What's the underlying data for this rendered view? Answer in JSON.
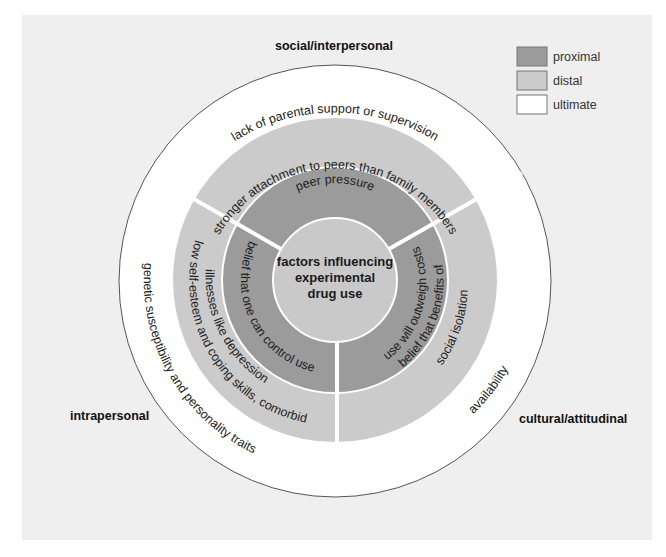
{
  "diagram": {
    "center_lines": [
      "factors influencing",
      "experimental",
      "drug use"
    ],
    "sectors": {
      "social_interpersonal": "social/interpersonal",
      "intrapersonal": "intrapersonal",
      "cultural_attitudinal": "cultural/attitudinal"
    },
    "ultimate": {
      "social": "lack of parental support or supervision",
      "intrapersonal": "genetic susceptibility and personality traits",
      "cultural": "availability"
    },
    "distal": {
      "social": "stronger attachment to peers than family members",
      "intrapersonal_line1": "low self-esteem and coping skills, comorbid",
      "intrapersonal_line2": "illnesses like depression",
      "cultural": "social isolation"
    },
    "proximal": {
      "social": "peer pressure",
      "intrapersonal": "belief that one can control use",
      "cultural_line1": "belief that benefits of",
      "cultural_line2": "use will outweigh costs"
    }
  },
  "legend": {
    "items": [
      {
        "label": "proximal",
        "color": "#9b9b9b"
      },
      {
        "label": "distal",
        "color": "#cbcbcb"
      },
      {
        "label": "ultimate",
        "color": "#ffffff"
      }
    ]
  },
  "colors": {
    "panel": "#efefef",
    "ultimate": "#ffffff",
    "distal": "#cbcbcb",
    "proximal": "#9b9b9b",
    "center": "#c9c9c9"
  }
}
